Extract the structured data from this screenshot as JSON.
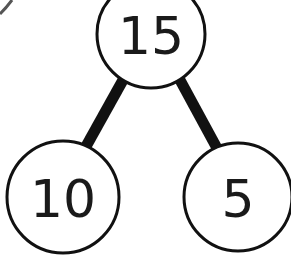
{
  "diagram": {
    "type": "number-bond",
    "whole": {
      "label": "15"
    },
    "parts": [
      {
        "label": "10"
      },
      {
        "label": "5"
      }
    ],
    "colors": {
      "stroke": "#111111",
      "text": "#1a1a1a",
      "background": "#ffffff"
    }
  }
}
